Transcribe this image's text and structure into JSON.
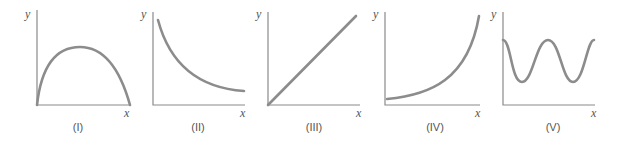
{
  "figure": {
    "panels": [
      {
        "id": "I",
        "caption": "(I)",
        "x_label": "x",
        "y_label": "y",
        "shape": "concave-down parabola starting and ending at x-axis"
      },
      {
        "id": "II",
        "caption": "(II)",
        "x_label": "x",
        "y_label": "y",
        "shape": "decreasing convex curve (decay)"
      },
      {
        "id": "III",
        "caption": "(III)",
        "x_label": "x",
        "y_label": "y",
        "shape": "straight line through origin, positive slope"
      },
      {
        "id": "IV",
        "caption": "(IV)",
        "x_label": "x",
        "y_label": "y",
        "shape": "increasing convex curve (exponential growth)"
      },
      {
        "id": "V",
        "caption": "(V)",
        "x_label": "x",
        "y_label": "y",
        "shape": "periodic oscillation (sinusoid)"
      }
    ],
    "colors": {
      "axis": "#8a8a8a",
      "curve": "#8c8c8c",
      "text": "#555555"
    }
  }
}
